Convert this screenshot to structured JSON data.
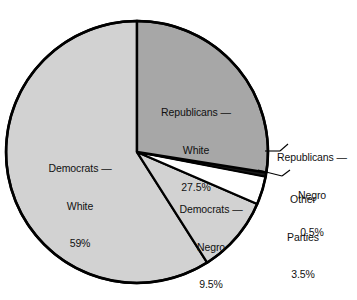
{
  "chart_data": {
    "type": "pie",
    "title": "",
    "subtitle": "",
    "xlabel": "",
    "ylabel": "",
    "legend_position": "none",
    "grid": false,
    "start_angle_deg": 0,
    "direction": "clockwise",
    "categories": [
      "Republicans — White",
      "Republicans — Negro",
      "Other Parties",
      "Democrats — Negro",
      "Democrats — White"
    ],
    "values": [
      27.5,
      0.5,
      3.5,
      9.5,
      59
    ],
    "value_labels": [
      "27.5%",
      "0.5%",
      "3.5%",
      "9.5%",
      "59%"
    ],
    "units": "percent",
    "slices": [
      {
        "id": "rep-white",
        "name_line1": "Republicans —",
        "name_line2": "White",
        "value": 27.5,
        "value_label": "27.5%",
        "color": "#a7a7a7",
        "label_placement": "inside"
      },
      {
        "id": "rep-negro",
        "name_line1": "Republicans —",
        "name_line2": "Negro",
        "value": 0.5,
        "value_label": "0.5%",
        "color": "#1a1a1a",
        "label_placement": "outside-leader"
      },
      {
        "id": "other-parties",
        "name_line1": "Other",
        "name_line2": "Parties",
        "value": 3.5,
        "value_label": "3.5%",
        "color": "#ffffff",
        "label_placement": "outside-leader"
      },
      {
        "id": "dem-negro",
        "name_line1": "Democrats —",
        "name_line2": "Negro",
        "value": 9.5,
        "value_label": "9.5%",
        "color": "#d2d2d2",
        "label_placement": "inside"
      },
      {
        "id": "dem-white",
        "name_line1": "Democrats —",
        "name_line2": "White",
        "value": 59,
        "value_label": "59%",
        "color": "#d2d2d2",
        "label_placement": "inside"
      }
    ],
    "geometry": {
      "center_x": 137,
      "center_y": 152,
      "radius": 131,
      "outline_color": "#000000",
      "outline_width": 2.4
    },
    "background_color": "#ffffff",
    "text_color": "#111111"
  }
}
